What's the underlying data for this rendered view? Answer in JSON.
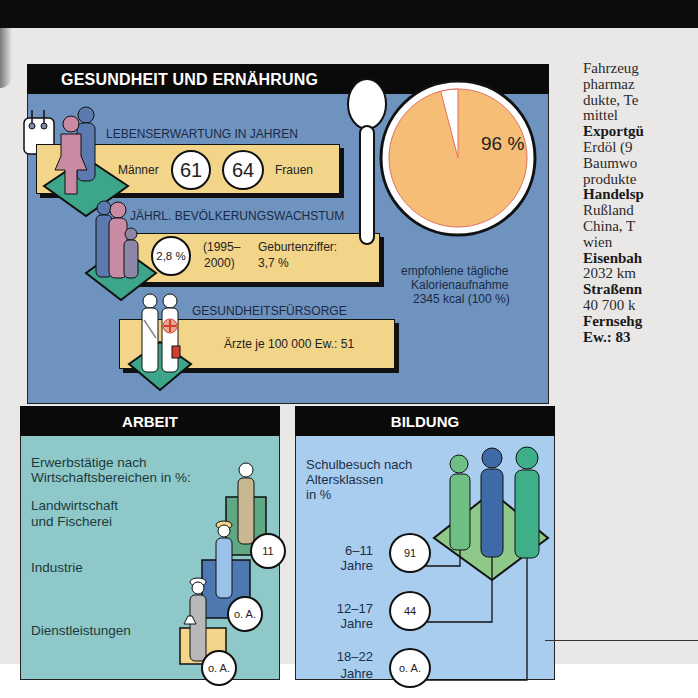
{
  "health": {
    "title": "GESUNDHEIT UND ERNÄHRUNG",
    "life_expectancy": {
      "title": "LEBENSERWARTUNG IN JAHREN",
      "men_label": "Männer",
      "men_value": "61",
      "women_value": "64",
      "women_label": "Frauen"
    },
    "population_growth": {
      "title": "JÄHRL. BEVÖLKERUNGSWACHSTUM",
      "value": "2,8 %",
      "period_line1": "(1995–",
      "period_line2": "2000)",
      "birth_rate_label": "Geburtenziffer:",
      "birth_rate_value": "3,7 %"
    },
    "healthcare": {
      "title": "GESUNDHEITSFÜRSORGE",
      "doctors": "Ärzte je 100 000 Ew.: 51"
    },
    "calories": {
      "percent_label": "96 %",
      "caption_line1": "empfohlene tägliche",
      "caption_line2": "Kalorienaufnahme",
      "caption_line3": "2345 kcal (100 %)"
    }
  },
  "work": {
    "title": "ARBEIT",
    "intro_line1": "Erwerbstätige nach",
    "intro_line2": "Wirtschaftsbereichen in %:",
    "sectors": [
      {
        "label_line1": "Landwirtschaft",
        "label_line2": "und Fischerei",
        "value": "11"
      },
      {
        "label_line1": "Industrie",
        "label_line2": "",
        "value": "o. A."
      },
      {
        "label_line1": "Dienstleistungen",
        "label_line2": "",
        "value": "o. A."
      }
    ]
  },
  "education": {
    "title": "BILDUNG",
    "intro_line1": "Schulbesuch nach",
    "intro_line2": "Altersklassen",
    "intro_line3": "in %",
    "groups": [
      {
        "age_line1": "6–11",
        "age_line2": "Jahre",
        "value": "91"
      },
      {
        "age_line1": "12–17",
        "age_line2": "Jahre",
        "value": "44"
      },
      {
        "age_line1": "18–22",
        "age_line2": "Jahre",
        "value": "o. A."
      }
    ]
  },
  "sidebar_text": {
    "lines": [
      {
        "text": "Fahrzeug",
        "bold": false
      },
      {
        "text": "pharmaz",
        "bold": false
      },
      {
        "text": "dukte, Te",
        "bold": false
      },
      {
        "text": "mittel",
        "bold": false
      },
      {
        "text": "Exportgü",
        "bold": true
      },
      {
        "text": "Erdöl (9",
        "bold": false
      },
      {
        "text": "Baumwo",
        "bold": false
      },
      {
        "text": "produkte",
        "bold": false
      },
      {
        "text": "Handelsp",
        "bold": true
      },
      {
        "text": "Rußland",
        "bold": false
      },
      {
        "text": "China, T",
        "bold": false
      },
      {
        "text": "wien",
        "bold": false
      },
      {
        "text": "Eisenbah",
        "bold": true
      },
      {
        "text": "2032 km",
        "bold": false
      },
      {
        "text": "Straßenn",
        "bold": true
      },
      {
        "text": "40 700 k",
        "bold": false
      },
      {
        "text": "Fernsehg",
        "bold": true
      },
      {
        "text": "Ew.: 83",
        "bold": true
      }
    ]
  },
  "colors": {
    "health_bg": "#6f93bf",
    "bar_yellow": "#f3d58a",
    "pie_orange": "#f6bd77",
    "work_bg": "#8fc8c9",
    "education_bg": "#a8cdef",
    "header_black": "#0a0a0a"
  }
}
